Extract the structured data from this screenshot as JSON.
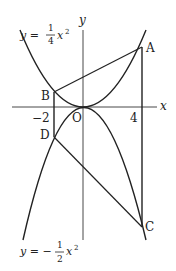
{
  "diagram": {
    "type": "parabola-geometry",
    "axes": {
      "x_label": "x",
      "y_label": "y",
      "origin_label": "O"
    },
    "ticks": {
      "x_neg": "−2",
      "x_pos": "4"
    },
    "curves": {
      "upper": {
        "prefix": "y =",
        "num": "1",
        "den": "4",
        "var": "x",
        "exp": "2",
        "equation": "y = 1/4 x^2"
      },
      "lower": {
        "prefix": "y = −",
        "num": "1",
        "den": "2",
        "var": "x",
        "exp": "2",
        "equation": "y = -1/2 x^2"
      }
    },
    "points": {
      "A": {
        "label": "A",
        "x": 4,
        "y": 4
      },
      "B": {
        "label": "B",
        "x": -2,
        "y": 1
      },
      "C": {
        "label": "C",
        "x": 4,
        "y": -8
      },
      "D": {
        "label": "D",
        "x": -2,
        "y": -2
      }
    },
    "segments": [
      "AB",
      "DC",
      "BD",
      "AC"
    ]
  }
}
